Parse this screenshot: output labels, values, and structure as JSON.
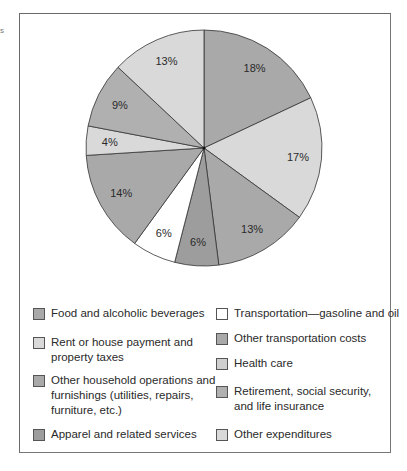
{
  "edge_mark": "s",
  "chart_data": {
    "type": "pie",
    "title": "",
    "start_angle_deg": 0,
    "direction": "clockwise",
    "slices": [
      {
        "label": "Food and alcoholic beverages",
        "value": 18,
        "display": "18%",
        "color": "#a9a9a9"
      },
      {
        "label": "Rent or house payment and property taxes",
        "value": 17,
        "display": "17%",
        "color": "#d9d9d9"
      },
      {
        "label": "Other household operations and furnishings (utilities, repairs, furniture, etc.)",
        "value": 13,
        "display": "13%",
        "color": "#a9a9a9"
      },
      {
        "label": "Apparel and related services",
        "value": 6,
        "display": "6%",
        "color": "#9d9d9d"
      },
      {
        "label": "Transportation—gasoline and oil",
        "value": 6,
        "display": "6%",
        "color": "#ffffff"
      },
      {
        "label": "Other transportation costs",
        "value": 14,
        "display": "14%",
        "color": "#a9a9a9"
      },
      {
        "label": "Health care",
        "value": 4,
        "display": "4%",
        "color": "#d9d9d9"
      },
      {
        "label": "Retirement, social security, and life insurance",
        "value": 9,
        "display": "9%",
        "color": "#b0b0b0"
      },
      {
        "label": "Other expenditures",
        "value": 13,
        "display": "13%",
        "color": "#d9d9d9"
      }
    ],
    "legend_position": "bottom"
  },
  "legend": {
    "left": [
      {
        "text": "Food and alcoholic beverages",
        "color": "#a9a9a9"
      },
      {
        "text": "Rent or house payment and\nproperty taxes",
        "color": "#d9d9d9"
      },
      {
        "text": "Other household operations and\nfurnishings (utilities, repairs,\nfurniture, etc.)",
        "color": "#a9a9a9"
      },
      {
        "text": "Apparel and related services",
        "color": "#9d9d9d"
      }
    ],
    "right": [
      {
        "text": "Transportation—gasoline and oil",
        "color": "#ffffff"
      },
      {
        "text": "Other transportation costs",
        "color": "#a9a9a9"
      },
      {
        "text": "Health care",
        "color": "#cfcfcf"
      },
      {
        "text": "Retirement, social security,\nand life insurance",
        "color": "#b0b0b0"
      },
      {
        "text": "Other expenditures",
        "color": "#d9d9d9"
      }
    ]
  }
}
